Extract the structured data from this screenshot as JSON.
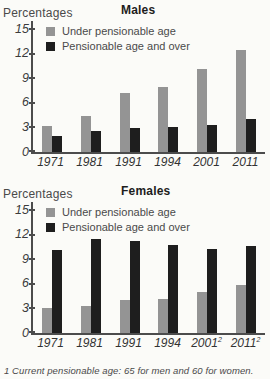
{
  "footnote": "1 Current pensionable age: 65 for men and 60 for women.",
  "chart_data": [
    {
      "type": "bar",
      "title": "Males",
      "ylabel": "Percentages",
      "xlabel": "",
      "y_ticks": [
        15,
        12,
        9,
        6,
        3,
        0
      ],
      "ylim": [
        0,
        16
      ],
      "grid": false,
      "legend_position": "top-left",
      "categories": [
        {
          "label": "1971",
          "sup": ""
        },
        {
          "label": "1981",
          "sup": ""
        },
        {
          "label": "1991",
          "sup": ""
        },
        {
          "label": "1994",
          "sup": ""
        },
        {
          "label": "2001",
          "sup": ""
        },
        {
          "label": "2011",
          "sup": ""
        }
      ],
      "series": [
        {
          "name": "Under pensionable age",
          "color": "#949494",
          "values": [
            3.2,
            4.4,
            7.2,
            8.0,
            10.2,
            12.5
          ]
        },
        {
          "name": "Pensionable age and over",
          "color": "#1e1e1e",
          "values": [
            2.0,
            2.6,
            2.9,
            3.1,
            3.3,
            4.0
          ]
        }
      ]
    },
    {
      "type": "bar",
      "title": "Females",
      "ylabel": "Percentages",
      "xlabel": "",
      "y_ticks": [
        15,
        12,
        9,
        6,
        3,
        0
      ],
      "ylim": [
        0,
        16
      ],
      "grid": false,
      "legend_position": "top-left",
      "categories": [
        {
          "label": "1971",
          "sup": ""
        },
        {
          "label": "1981",
          "sup": ""
        },
        {
          "label": "1991",
          "sup": ""
        },
        {
          "label": "1994",
          "sup": ""
        },
        {
          "label": "2001",
          "sup": "2"
        },
        {
          "label": "2011",
          "sup": "2"
        }
      ],
      "series": [
        {
          "name": "Under pensionable age",
          "color": "#949494",
          "values": [
            3.0,
            3.3,
            4.0,
            4.1,
            5.0,
            5.9
          ]
        },
        {
          "name": "Pensionable age and over",
          "color": "#1e1e1e",
          "values": [
            10.1,
            11.5,
            11.2,
            10.8,
            10.3,
            10.6
          ]
        }
      ]
    }
  ]
}
